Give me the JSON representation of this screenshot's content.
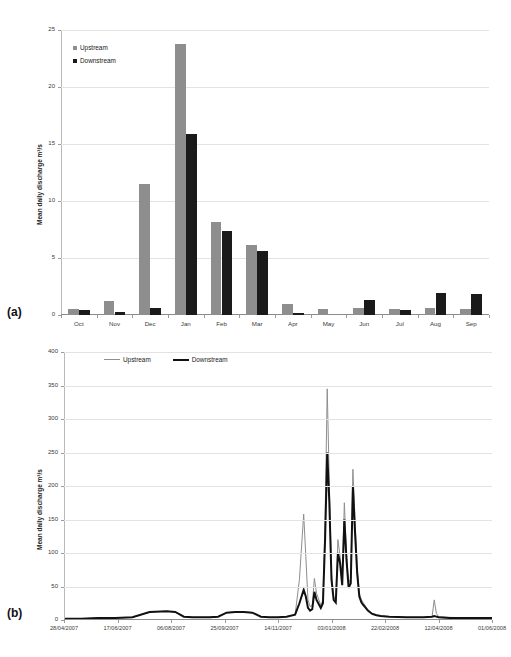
{
  "figure": {
    "panel_a_tag": "(a)",
    "panel_b_tag": "(b)"
  },
  "chart_data": [
    {
      "id": "panel-a",
      "type": "bar",
      "title": "",
      "xlabel": "",
      "ylabel": "Mean daily discharge  m³/s",
      "ylim": [
        0,
        25
      ],
      "yticks": [
        0,
        5,
        10,
        15,
        20,
        25
      ],
      "ytick_labels": [
        "0",
        "5",
        "10",
        "15",
        "20",
        "25"
      ],
      "grid": true,
      "legend_position": "top-left",
      "categories": [
        "Oct",
        "Nov",
        "Dec",
        "Jan",
        "Feb",
        "Mar",
        "Apr",
        "May",
        "Jun",
        "Jul",
        "Aug",
        "Sep"
      ],
      "series": [
        {
          "name": "Upstream",
          "color": "#8e8e8e",
          "values": [
            0.5,
            1.2,
            11.5,
            23.8,
            8.2,
            6.1,
            1.0,
            0.5,
            0.6,
            0.5,
            0.6,
            0.5
          ]
        },
        {
          "name": "Downstream",
          "color": "#1a1a1a",
          "values": [
            0.45,
            0.3,
            0.6,
            15.9,
            7.4,
            5.6,
            0.15,
            0.0,
            1.3,
            0.45,
            1.9,
            1.8
          ]
        }
      ]
    },
    {
      "id": "panel-b",
      "type": "line",
      "title": "",
      "xlabel": "",
      "ylabel": "Mean daily discharge m³/s",
      "ylim": [
        0,
        400
      ],
      "yticks": [
        0,
        50,
        100,
        150,
        200,
        250,
        300,
        350,
        400
      ],
      "ytick_labels": [
        "0",
        "50",
        "100",
        "150",
        "200",
        "250",
        "300",
        "350",
        "400"
      ],
      "grid": true,
      "legend_position": "top-left",
      "xtick_labels": [
        "28/04/2007",
        "17/06/2007",
        "06/08/2007",
        "25/09/2007",
        "14/11/2007",
        "03/01/2008",
        "22/02/2008",
        "12/04/2008",
        "01/06/2008"
      ],
      "x": [
        0,
        0.04,
        0.08,
        0.12,
        0.16,
        0.2,
        0.24,
        0.26,
        0.28,
        0.3,
        0.32,
        0.34,
        0.36,
        0.38,
        0.4,
        0.42,
        0.44,
        0.46,
        0.48,
        0.5,
        0.52,
        0.54,
        0.55,
        0.56,
        0.565,
        0.57,
        0.575,
        0.58,
        0.585,
        0.59,
        0.6,
        0.605,
        0.61,
        0.615,
        0.62,
        0.625,
        0.63,
        0.635,
        0.64,
        0.645,
        0.65,
        0.655,
        0.66,
        0.665,
        0.67,
        0.675,
        0.68,
        0.685,
        0.69,
        0.695,
        0.7,
        0.705,
        0.71,
        0.72,
        0.73,
        0.74,
        0.76,
        0.8,
        0.84,
        0.86,
        0.865,
        0.87,
        0.875,
        0.9,
        0.95,
        1.0
      ],
      "series": [
        {
          "name": "Upstream",
          "color": "#8e8e8e",
          "width": 1,
          "values": [
            2,
            2,
            3,
            3,
            4,
            12,
            13,
            12,
            5,
            4,
            4,
            4,
            5,
            11,
            12,
            12,
            11,
            5,
            4,
            4,
            5,
            8,
            60,
            158,
            95,
            30,
            20,
            22,
            62,
            40,
            22,
            30,
            150,
            345,
            200,
            70,
            35,
            30,
            120,
            95,
            60,
            175,
            100,
            55,
            62,
            225,
            150,
            80,
            40,
            30,
            25,
            20,
            15,
            10,
            8,
            6,
            5,
            4,
            4,
            5,
            30,
            10,
            5,
            4,
            3,
            3
          ]
        },
        {
          "name": "Downstream",
          "color": "#111111",
          "width": 2,
          "values": [
            2,
            2,
            3,
            3,
            4,
            12,
            13,
            12,
            5,
            4,
            4,
            4,
            5,
            11,
            12,
            12,
            11,
            5,
            4,
            4,
            5,
            8,
            25,
            45,
            35,
            18,
            14,
            16,
            42,
            30,
            18,
            25,
            120,
            250,
            175,
            60,
            30,
            26,
            100,
            85,
            52,
            150,
            90,
            48,
            55,
            200,
            130,
            70,
            35,
            26,
            22,
            18,
            14,
            9,
            7,
            6,
            5,
            4,
            4,
            5,
            6,
            5,
            4,
            3,
            3,
            3
          ]
        }
      ]
    }
  ]
}
